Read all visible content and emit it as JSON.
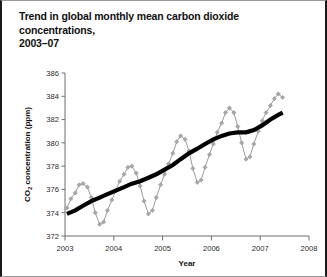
{
  "figure": {
    "title": "Trend in global monthly mean carbon dioxide concentrations,\n2003–07"
  },
  "chart_data": {
    "type": "line",
    "title": "Trend in global monthly mean carbon dioxide concentrations, 2003–07",
    "xlabel": "Year",
    "ylabel": "CO2 concentration (ppm)",
    "ylabel_parts": {
      "prefix": "CO",
      "sub": "2",
      "suffix": " concentration (ppm)"
    },
    "xlim": [
      2003,
      2008
    ],
    "ylim": [
      372,
      386
    ],
    "xticks": [
      2003,
      2004,
      2005,
      2006,
      2007,
      2008
    ],
    "xticklabels": [
      "2003",
      "2004",
      "2005",
      "2006",
      "2007",
      "2008"
    ],
    "yticks": [
      372,
      374,
      376,
      378,
      380,
      382,
      384,
      386
    ],
    "yticklabels": [
      "372",
      "374",
      "376",
      "378",
      "380",
      "382",
      "384",
      "386"
    ],
    "grid": false,
    "legend": "none",
    "colors": {
      "monthly": "#a0a0a0",
      "trend": "#000000",
      "axis": "#6e6e6e"
    },
    "series": [
      {
        "name": "Monthly mean",
        "style": "line-with-diamond-markers",
        "color": "#a0a0a0",
        "x": [
          2003.04,
          2003.12,
          2003.21,
          2003.29,
          2003.37,
          2003.46,
          2003.54,
          2003.62,
          2003.71,
          2003.79,
          2003.87,
          2003.96,
          2004.04,
          2004.12,
          2004.21,
          2004.29,
          2004.37,
          2004.46,
          2004.54,
          2004.62,
          2004.71,
          2004.79,
          2004.87,
          2004.96,
          2005.04,
          2005.12,
          2005.21,
          2005.29,
          2005.37,
          2005.46,
          2005.54,
          2005.62,
          2005.71,
          2005.79,
          2005.87,
          2005.96,
          2006.04,
          2006.12,
          2006.21,
          2006.29,
          2006.37,
          2006.46,
          2006.54,
          2006.62,
          2006.71,
          2006.79,
          2006.87,
          2006.96,
          2007.04,
          2007.12,
          2007.21,
          2007.29,
          2007.37,
          2007.46
        ],
        "values": [
          374.4,
          375.2,
          375.7,
          376.4,
          376.5,
          376.2,
          375.3,
          374.0,
          373.0,
          373.2,
          374.2,
          375.1,
          375.9,
          376.7,
          377.3,
          377.9,
          378.0,
          377.4,
          376.3,
          375.0,
          373.9,
          374.2,
          375.3,
          376.4,
          377.3,
          378.2,
          379.1,
          380.1,
          380.6,
          380.3,
          379.3,
          377.8,
          376.6,
          376.8,
          377.9,
          379.0,
          379.9,
          380.9,
          381.7,
          382.6,
          383.0,
          382.6,
          381.4,
          380.0,
          378.6,
          378.8,
          379.9,
          381.0,
          381.9,
          382.6,
          383.2,
          383.8,
          384.2,
          383.9
        ]
      },
      {
        "name": "Trend",
        "style": "thick-line",
        "color": "#000000",
        "x": [
          2003.04,
          2003.21,
          2003.37,
          2003.54,
          2003.71,
          2003.87,
          2004.04,
          2004.21,
          2004.37,
          2004.54,
          2004.71,
          2004.87,
          2005.04,
          2005.21,
          2005.37,
          2005.54,
          2005.71,
          2005.87,
          2006.04,
          2006.21,
          2006.37,
          2006.54,
          2006.71,
          2006.87,
          2007.04,
          2007.21,
          2007.37,
          2007.46
        ],
        "values": [
          373.9,
          374.2,
          374.6,
          375.0,
          375.3,
          375.6,
          375.9,
          376.2,
          376.5,
          376.7,
          377.0,
          377.3,
          377.7,
          378.1,
          378.6,
          379.1,
          379.5,
          379.9,
          380.3,
          380.6,
          380.8,
          380.9,
          380.9,
          381.1,
          381.5,
          382.0,
          382.4,
          382.6
        ]
      }
    ]
  }
}
